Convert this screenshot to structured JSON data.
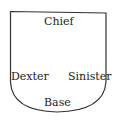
{
  "diagram": {
    "type": "heraldic-shield",
    "labels": {
      "top": "Chief",
      "left": "Dexter",
      "right": "Sinister",
      "bottom": "Base"
    },
    "colors": {
      "outline": "#333333",
      "text": "#222222",
      "background": "#ffffff"
    }
  }
}
